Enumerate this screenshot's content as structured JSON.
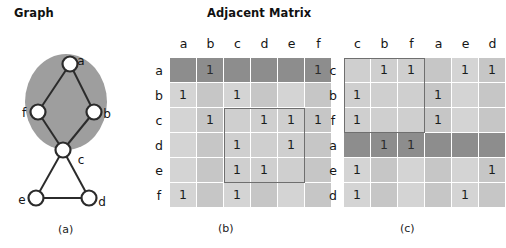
{
  "headings": {
    "graph": "Graph",
    "matrix": "Adjacent Matrix"
  },
  "captions": {
    "a": "(a)",
    "b": "(b)",
    "c": "(c)"
  },
  "colors": {
    "cell_light": "#d4d4d4",
    "cell_band": "#c6c6c6",
    "cell_highlight_dark": "#8d8d8d",
    "box_outline": "#6f6f6f",
    "node_stroke": "#2b2b2b",
    "cluster_fill": "#9e9e9e",
    "grid_line": "#ffffff"
  },
  "graph": {
    "nodes": [
      {
        "id": "a",
        "label": "a",
        "x": 62,
        "y": 18,
        "label_dx": 11,
        "label_dy": -3
      },
      {
        "id": "f",
        "label": "f",
        "x": 30,
        "y": 66,
        "label_dx": -14,
        "label_dy": 1
      },
      {
        "id": "b",
        "label": "b",
        "x": 86,
        "y": 66,
        "label_dx": 13,
        "label_dy": 2
      },
      {
        "id": "c",
        "label": "c",
        "x": 55,
        "y": 104,
        "label_dx": 18,
        "label_dy": 10
      },
      {
        "id": "e",
        "label": "e",
        "x": 28,
        "y": 152,
        "label_dx": -14,
        "label_dy": 2
      },
      {
        "id": "d",
        "label": "d",
        "x": 81,
        "y": 152,
        "label_dx": 13,
        "label_dy": 4
      }
    ],
    "edges": [
      [
        "a",
        "f"
      ],
      [
        "a",
        "b"
      ],
      [
        "f",
        "c"
      ],
      [
        "b",
        "c"
      ],
      [
        "c",
        "e"
      ],
      [
        "c",
        "d"
      ],
      [
        "e",
        "d"
      ]
    ],
    "cluster": {
      "label": "abf-cluster",
      "cx": 58,
      "cy": 56,
      "rx": 41,
      "ry": 48
    },
    "node_radius": 7.5
  },
  "matrix_b": {
    "name": "adjacency-matrix-original-order",
    "col_labels": [
      "a",
      "b",
      "c",
      "d",
      "e",
      "f"
    ],
    "row_labels": [
      "a",
      "b",
      "c",
      "d",
      "e",
      "f"
    ],
    "rows": [
      [
        0,
        1,
        0,
        0,
        0,
        1
      ],
      [
        1,
        0,
        1,
        0,
        0,
        0
      ],
      [
        0,
        1,
        0,
        1,
        1,
        1
      ],
      [
        0,
        0,
        1,
        0,
        1,
        0
      ],
      [
        0,
        0,
        1,
        1,
        0,
        0
      ],
      [
        1,
        0,
        1,
        0,
        0,
        0
      ]
    ],
    "highlight_row_index": 0,
    "highlight_row_label": "a",
    "band_columns": [
      1,
      3,
      5
    ],
    "outline_box": {
      "row_start": 2,
      "row_end": 4,
      "col_start": 2,
      "col_end": 4
    }
  },
  "matrix_c": {
    "name": "adjacency-matrix-reordered",
    "col_labels": [
      "c",
      "b",
      "f",
      "a",
      "e",
      "d"
    ],
    "row_labels": [
      "c",
      "b",
      "f",
      "a",
      "e",
      "d"
    ],
    "rows": [
      [
        0,
        1,
        1,
        0,
        1,
        1
      ],
      [
        1,
        0,
        0,
        1,
        0,
        0
      ],
      [
        1,
        0,
        0,
        1,
        0,
        0
      ],
      [
        0,
        1,
        1,
        0,
        0,
        0
      ],
      [
        1,
        0,
        0,
        0,
        0,
        1
      ],
      [
        1,
        0,
        0,
        0,
        1,
        0
      ]
    ],
    "highlight_row_index": 3,
    "highlight_row_label": "a",
    "band_columns": [
      1,
      3,
      5
    ],
    "outline_box": {
      "row_start": 0,
      "row_end": 2,
      "col_start": 0,
      "col_end": 2
    }
  }
}
